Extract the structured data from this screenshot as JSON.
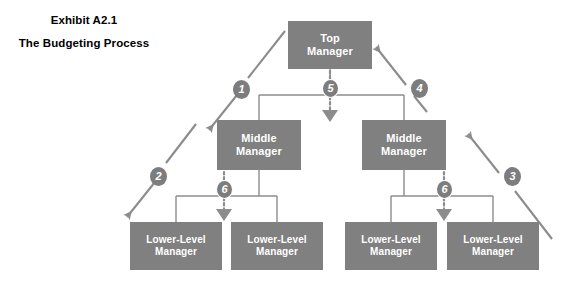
{
  "exhibit": {
    "number": "Exhibit A2.1",
    "title": "The Budgeting Process"
  },
  "nodes": {
    "top_manager": "Top\nManager",
    "middle_manager_left": "Middle\nManager",
    "middle_manager_right": "Middle\nManager",
    "lower_manager_1": "Lower-Level\nManager",
    "lower_manager_2": "Lower-Level\nManager",
    "lower_manager_3": "Lower-Level\nManager",
    "lower_manager_4": "Lower-Level\nManager"
  },
  "steps": {
    "step_1": "1",
    "step_2": "2",
    "step_3": "3",
    "step_4": "4",
    "step_5": "5",
    "step_6_left": "6",
    "step_6_right": "6"
  },
  "colors": {
    "node_fill": "#808080",
    "node_text": "#ffffff",
    "badge_fill": "#7d7d7d",
    "connector": "#8c8c8c",
    "arrow": "#8c8c8c",
    "background": "#ffffff",
    "caption_text": "#000000"
  },
  "icons": {
    "arrow_down_left": "arrow-down-left-icon",
    "arrow_up_left": "arrow-up-left-icon",
    "arrow_down": "arrow-down-icon"
  }
}
